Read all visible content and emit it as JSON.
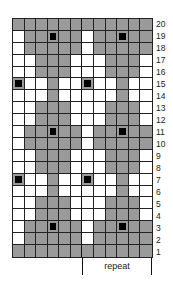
{
  "chart_data": {
    "type": "table",
    "title": "",
    "columns": 12,
    "rows": 20,
    "legend": {
      "G": "gray (contrast color)",
      "W": "white (main color)",
      "B": "black square (bobble/marker)"
    },
    "row_labels": [
      "20",
      "19",
      "18",
      "17",
      "16",
      "15",
      "14",
      "13",
      "12",
      "11",
      "10",
      "9",
      "8",
      "7",
      "6",
      "5",
      "4",
      "3",
      "2",
      "1"
    ],
    "grid_top_to_bottom": [
      [
        "G",
        "G",
        "G",
        "G",
        "G",
        "G",
        "G",
        "G",
        "G",
        "G",
        "G",
        "G"
      ],
      [
        "W",
        "G",
        "G",
        "B",
        "G",
        "G",
        "W",
        "G",
        "G",
        "B",
        "G",
        "G"
      ],
      [
        "W",
        "G",
        "G",
        "G",
        "G",
        "G",
        "W",
        "G",
        "G",
        "G",
        "G",
        "G"
      ],
      [
        "W",
        "W",
        "G",
        "G",
        "G",
        "W",
        "W",
        "W",
        "G",
        "G",
        "G",
        "W"
      ],
      [
        "W",
        "W",
        "G",
        "G",
        "G",
        "W",
        "W",
        "W",
        "G",
        "G",
        "G",
        "W"
      ],
      [
        "B",
        "W",
        "W",
        "G",
        "W",
        "W",
        "B",
        "W",
        "W",
        "G",
        "W",
        "W"
      ],
      [
        "W",
        "W",
        "W",
        "G",
        "W",
        "W",
        "W",
        "W",
        "W",
        "G",
        "W",
        "W"
      ],
      [
        "W",
        "W",
        "G",
        "G",
        "G",
        "W",
        "W",
        "W",
        "G",
        "G",
        "G",
        "W"
      ],
      [
        "W",
        "W",
        "G",
        "G",
        "G",
        "W",
        "W",
        "W",
        "G",
        "G",
        "G",
        "W"
      ],
      [
        "W",
        "G",
        "G",
        "B",
        "G",
        "G",
        "W",
        "G",
        "G",
        "B",
        "G",
        "G"
      ],
      [
        "W",
        "G",
        "G",
        "G",
        "G",
        "G",
        "W",
        "G",
        "G",
        "G",
        "G",
        "G"
      ],
      [
        "W",
        "W",
        "G",
        "G",
        "G",
        "W",
        "W",
        "W",
        "G",
        "G",
        "G",
        "W"
      ],
      [
        "W",
        "W",
        "G",
        "G",
        "G",
        "W",
        "W",
        "W",
        "G",
        "G",
        "G",
        "W"
      ],
      [
        "B",
        "W",
        "W",
        "G",
        "W",
        "W",
        "B",
        "W",
        "W",
        "G",
        "W",
        "W"
      ],
      [
        "W",
        "W",
        "W",
        "G",
        "W",
        "W",
        "W",
        "W",
        "W",
        "G",
        "W",
        "W"
      ],
      [
        "W",
        "W",
        "G",
        "G",
        "G",
        "W",
        "W",
        "W",
        "G",
        "G",
        "G",
        "W"
      ],
      [
        "W",
        "W",
        "G",
        "G",
        "G",
        "W",
        "W",
        "W",
        "G",
        "G",
        "G",
        "W"
      ],
      [
        "W",
        "G",
        "G",
        "B",
        "G",
        "G",
        "W",
        "G",
        "G",
        "B",
        "G",
        "G"
      ],
      [
        "W",
        "G",
        "G",
        "G",
        "G",
        "G",
        "W",
        "G",
        "G",
        "G",
        "G",
        "G"
      ],
      [
        "G",
        "G",
        "G",
        "G",
        "G",
        "G",
        "G",
        "G",
        "G",
        "G",
        "G",
        "G"
      ]
    ],
    "repeat": {
      "label": "repeat",
      "start_col": 7,
      "end_col": 12
    }
  },
  "colors": {
    "gray": "#9a9a9a",
    "white": "#ffffff",
    "black": "#000000",
    "grid_line": "#222222"
  },
  "repeat_label": "repeat"
}
